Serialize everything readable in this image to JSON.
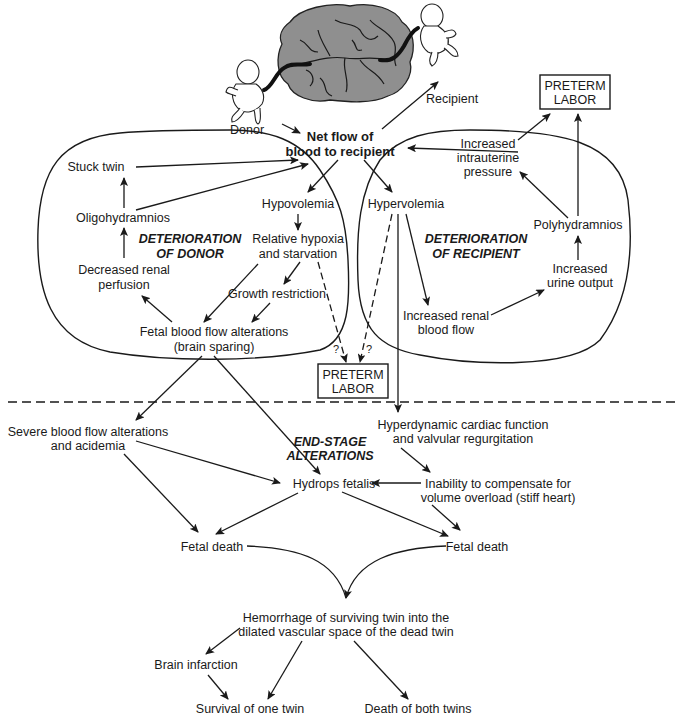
{
  "illustration": {
    "donor_label": "Donor",
    "recipient_label": "Recipient"
  },
  "center": {
    "net_flow_line1": "Net flow of",
    "net_flow_line2": "blood to recipient"
  },
  "donor_region": {
    "title_line1": "DETERIORATION",
    "title_line2": "OF DONOR",
    "nodes": {
      "stuck_twin": "Stuck twin",
      "oligohydramnios": "Oligohydramnios",
      "decreased_renal_1": "Decreased renal",
      "decreased_renal_2": "perfusion",
      "hypovolemia": "Hypovolemia",
      "hypoxia_1": "Relative hypoxia",
      "hypoxia_2": "and starvation",
      "growth_restriction": "Growth restriction",
      "fetal_flow_1": "Fetal blood flow alterations",
      "fetal_flow_2": "(brain sparing)"
    }
  },
  "recipient_region": {
    "title_line1": "DETERIORATION",
    "title_line2": "OF RECIPIENT",
    "nodes": {
      "hypervolemia": "Hypervolemia",
      "intrauterine_1": "Increased",
      "intrauterine_2": "intrauterine",
      "intrauterine_3": "pressure",
      "polyhydramnios": "Polyhydramnios",
      "urine_1": "Increased",
      "urine_2": "urine output",
      "renal_flow_1": "Increased renal",
      "renal_flow_2": "blood flow"
    }
  },
  "preterm_top": {
    "line1": "PRETERM",
    "line2": "LABOR"
  },
  "preterm_mid": {
    "line1": "PRETERM",
    "line2": "LABOR",
    "question_left": "?",
    "question_right": "?"
  },
  "end_stage": {
    "title_line1": "END-STAGE",
    "title_line2": "ALTERATIONS",
    "nodes": {
      "severe_1": "Severe blood flow alterations",
      "severe_2": "and acidemia",
      "hyperdynamic_1": "Hyperdynamic cardiac function",
      "hyperdynamic_2": "and valvular regurgitation",
      "hydrops": "Hydrops fetalis",
      "inability_1": "Inability to compensate for",
      "inability_2": "volume overload (stiff heart)",
      "fetal_death_left": "Fetal death",
      "fetal_death_right": "Fetal death"
    }
  },
  "outcomes": {
    "hemorrhage_1": "Hemorrhage of surviving twin into the",
    "hemorrhage_2": "dilated vascular space of the dead twin",
    "brain_infarction": "Brain infarction",
    "survival": "Survival of one twin",
    "death_both": "Death of both twins"
  },
  "colors": {
    "ink": "#1a1a1a",
    "placenta_fill": "#8f8f8f",
    "background": "#ffffff"
  }
}
